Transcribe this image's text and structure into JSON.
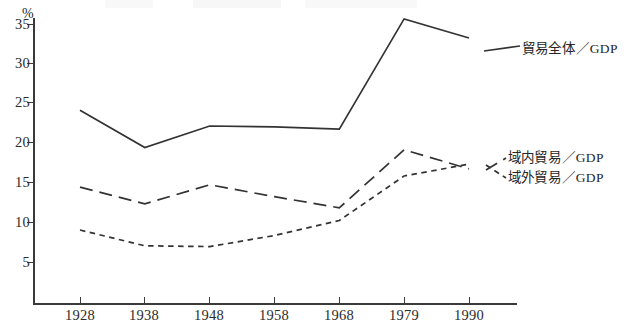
{
  "figure": {
    "y_axis_unit_label": "%",
    "y_ticks": [
      "35",
      "30",
      "25",
      "20",
      "15",
      "10",
      "5"
    ],
    "x_ticks": [
      "1928",
      "1938",
      "1948",
      "1958",
      "1968",
      "1979",
      "1990"
    ],
    "legend": {
      "total": {
        "cjk": "貿易全体",
        "slash": "／",
        "latin": "GDP"
      },
      "intra": {
        "cjk": "域内貿易",
        "slash": "／",
        "latin": "GDP"
      },
      "extra": {
        "cjk": "域外貿易",
        "slash": "／",
        "latin": "GDP"
      }
    },
    "colors": {
      "ink": "#2b2b2b",
      "axis": "#3a3a3a",
      "line": "#333333"
    }
  },
  "chart_data": {
    "type": "line",
    "title": "",
    "subtitle": "",
    "xlabel": "",
    "ylabel": "%",
    "x": [
      "1928",
      "1938",
      "1948",
      "1958",
      "1968",
      "1979",
      "1990"
    ],
    "xlim": [
      1928,
      1990
    ],
    "ylim": [
      0,
      37
    ],
    "ytick_values": [
      5,
      10,
      15,
      20,
      25,
      30,
      35
    ],
    "grid": false,
    "legend_position": "right-inline",
    "series": [
      {
        "name": "貿易全体／GDP",
        "style": "solid",
        "values": [
          24.2,
          19.5,
          22.2,
          22.1,
          21.8,
          35.7,
          33.3
        ]
      },
      {
        "name": "域内貿易／GDP",
        "style": "long-dash",
        "values": [
          14.5,
          12.4,
          14.8,
          13.3,
          11.9,
          19.2,
          16.8
        ]
      },
      {
        "name": "域外貿易／GDP",
        "style": "short-dash",
        "values": [
          9.1,
          7.1,
          7.0,
          8.4,
          10.3,
          15.9,
          17.4
        ]
      }
    ]
  }
}
